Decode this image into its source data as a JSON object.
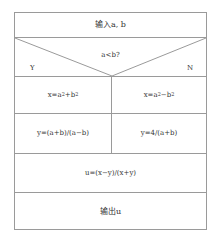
{
  "flowchart": {
    "type": "N-S structured flowchart",
    "input": {
      "label": "输入a, b"
    },
    "decision": {
      "condition": "a<b?",
      "yes_label": "Y",
      "no_label": "N"
    },
    "branch_yes": {
      "step1": {
        "base": "x=a",
        "exp1": "2",
        "mid": "+b",
        "exp2": "2",
        "full": "x=a²+b²"
      },
      "step2": {
        "label": "y=(a+b)/(a−b)"
      }
    },
    "branch_no": {
      "step1": {
        "base": "x=a",
        "exp1": "2",
        "mid": "−b",
        "exp2": "2",
        "full": "x=a²−b²"
      },
      "step2": {
        "label": "y=4/(a+b)"
      }
    },
    "compute": {
      "label": "u=(x−y)/(x+y)"
    },
    "output": {
      "label": "输出u"
    },
    "colors": {
      "line": "#9a9a9a",
      "text": "#333333",
      "background": "#ffffff"
    }
  }
}
